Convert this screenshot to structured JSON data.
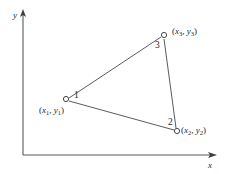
{
  "figure": {
    "background_color": "#ffffff",
    "line_color": "#45484c",
    "axis_color": "#55585c",
    "text_color": "#25282b"
  },
  "axes": {
    "x_label": "x",
    "y_label": "y",
    "origin": {
      "x": 23,
      "y": 155
    },
    "x_axis_end": {
      "x": 216,
      "y": 155
    },
    "y_axis_end": {
      "x": 23,
      "y": 11
    },
    "arrowheads": true,
    "grid": false,
    "ticks": []
  },
  "vertices": [
    {
      "id": "1",
      "number_label": "1",
      "coord_label": "(x1, y1)",
      "coord_var_x": "x",
      "coord_var_y": "y",
      "subscript": "1",
      "px": 66,
      "py": 99
    },
    {
      "id": "2",
      "number_label": "2",
      "coord_label": "(x2, y2)",
      "coord_var_x": "x",
      "coord_var_y": "y",
      "subscript": "2",
      "px": 177,
      "py": 131
    },
    {
      "id": "3",
      "number_label": "3",
      "coord_label": "(x3, y3)",
      "coord_var_x": "x",
      "coord_var_y": "y",
      "subscript": "3",
      "px": 164,
      "py": 35
    }
  ],
  "edges": [
    {
      "from": "1",
      "to": "3"
    },
    {
      "from": "3",
      "to": "2"
    },
    {
      "from": "2",
      "to": "1"
    }
  ],
  "punctuation": {
    "open_paren": "(",
    "close_paren": ")",
    "comma": ", "
  }
}
